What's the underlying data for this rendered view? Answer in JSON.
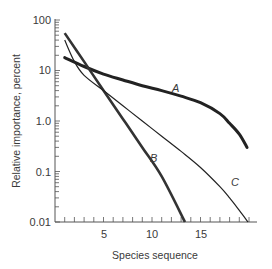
{
  "chart_data": {
    "type": "line",
    "title": "",
    "xlabel": "Species sequence",
    "ylabel": "Relative importance, percent",
    "yscale": "log",
    "ylim": [
      0.01,
      100
    ],
    "xlim": [
      0,
      20
    ],
    "x_ticks": [
      5,
      10,
      15
    ],
    "y_ticks": [
      "0.01",
      "0.1",
      "1.0",
      "10",
      "100"
    ],
    "grid": false,
    "legend": "inline curve labels",
    "series": [
      {
        "name": "A",
        "x": [
          1,
          3,
          5,
          7,
          9,
          11,
          13,
          15,
          17,
          18,
          19,
          19.8
        ],
        "values": [
          18,
          12,
          8.5,
          6.5,
          5,
          4,
          3.1,
          2.3,
          1.4,
          0.9,
          0.55,
          0.3
        ]
      },
      {
        "name": "B",
        "x": [
          1,
          3,
          5,
          7,
          9,
          11,
          13.4
        ],
        "values": [
          55,
          15,
          4,
          1.1,
          0.3,
          0.08,
          0.01
        ]
      },
      {
        "name": "C",
        "x": [
          1,
          2,
          3,
          5,
          7,
          9,
          11,
          13,
          15,
          17,
          18,
          19,
          19.9
        ],
        "values": [
          40,
          15,
          8,
          4,
          2,
          1,
          0.5,
          0.25,
          0.12,
          0.05,
          0.03,
          0.017,
          0.01
        ]
      }
    ],
    "annotations": [
      "A",
      "B",
      "C"
    ]
  },
  "labels": {
    "y_axis": "Relative importance, percent",
    "x_axis": "Species sequence",
    "curve_a": "A",
    "curve_b": "B",
    "curve_c": "C",
    "ytick_100": "100",
    "ytick_10": "10",
    "ytick_1": "1.0",
    "ytick_01": "0.1",
    "ytick_001": "0.01",
    "xtick_5": "5",
    "xtick_10": "10",
    "xtick_15": "15"
  }
}
